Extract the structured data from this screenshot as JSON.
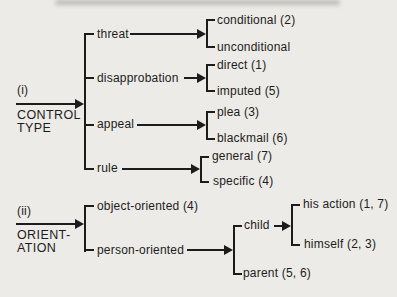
{
  "page": {
    "background": "#ecebe7",
    "ink": "#1c1c1c"
  },
  "tree": {
    "control": {
      "index": "(i)",
      "title_line1": "CONTROL",
      "title_line2": "TYPE",
      "threat": {
        "label": "threat",
        "leaf1": "conditional (2)",
        "leaf2": "unconditional"
      },
      "disapprobation": {
        "label": "disapprobation",
        "leaf1": "direct (1)",
        "leaf2": "imputed (5)"
      },
      "appeal": {
        "label": "appeal",
        "leaf1": "plea (3)",
        "leaf2": "blackmail (6)"
      },
      "rule": {
        "label": "rule",
        "leaf1": "general (7)",
        "leaf2": "specific (4)"
      }
    },
    "orientation": {
      "index": "(ii)",
      "title_line1": "ORIENT-",
      "title_line2": "ATION",
      "object": {
        "label": "object-oriented (4)"
      },
      "person": {
        "label": "person-oriented"
      },
      "child": {
        "label": "child",
        "leaf1": "his action (1, 7)",
        "leaf2": "himself (2, 3)"
      },
      "parent": {
        "label": "parent (5, 6)"
      }
    }
  }
}
